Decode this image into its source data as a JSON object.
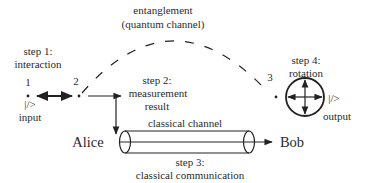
{
  "diagram": {
    "entanglement": {
      "line1": "entanglement",
      "line2": "(quantum channel)"
    },
    "step1": {
      "line1": "step 1:",
      "line2": "interaction"
    },
    "step2": {
      "line1": "step 2:",
      "line2": "measurement",
      "line3": "result"
    },
    "step3": {
      "line1": "step 3:",
      "line2": "classical communication"
    },
    "step4": {
      "line1": "step 4:",
      "line2": "rotation"
    },
    "nodes": {
      "n1": "1",
      "n2": "2",
      "n3": "3"
    },
    "input": {
      "state": "|/>",
      "label": "input"
    },
    "output": {
      "state": "|/>",
      "label": "output"
    },
    "channel": {
      "label": "classical channel"
    },
    "parties": {
      "sender": "Alice",
      "receiver": "Bob"
    },
    "colors": {
      "ink": "#222222",
      "background": "#ffffff"
    }
  }
}
